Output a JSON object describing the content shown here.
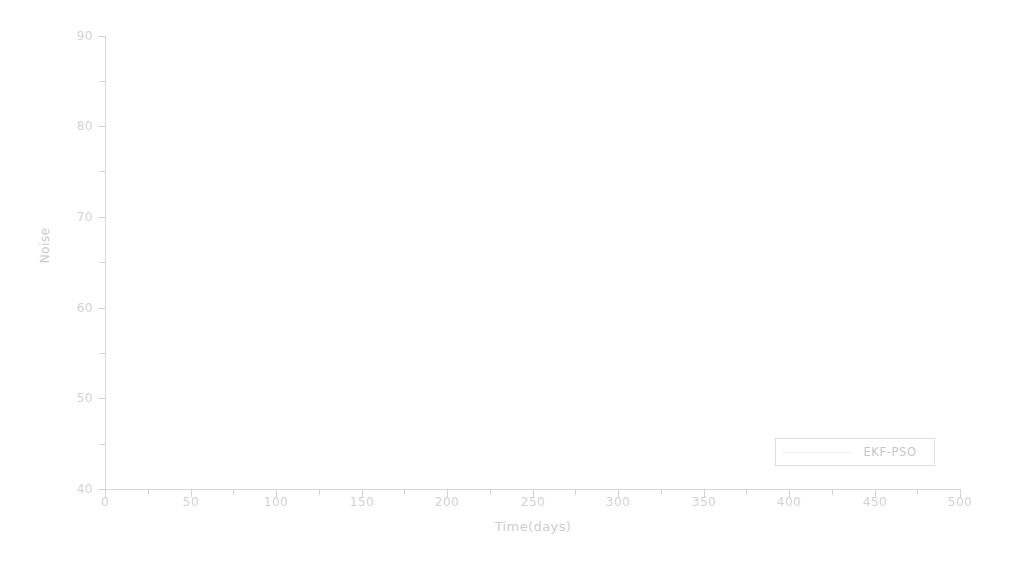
{
  "chart_data": {
    "type": "line",
    "title": "",
    "xlabel": "Time(days)",
    "ylabel": "Noise",
    "xlim": [
      0,
      500
    ],
    "ylim": [
      40,
      90
    ],
    "xticks": [
      0,
      50,
      100,
      150,
      200,
      250,
      300,
      350,
      400,
      450,
      500
    ],
    "yticks": [
      40,
      50,
      60,
      70,
      80,
      90
    ],
    "xtick_labels": [
      "0",
      "50",
      "100",
      "150",
      "200",
      "250",
      "300",
      "350",
      "400",
      "450",
      "500"
    ],
    "ytick_labels": [
      "40",
      "50",
      "60",
      "70",
      "80",
      "90"
    ],
    "grid": false,
    "legend_position": "lower right",
    "series": [
      {
        "name": "EKF-PSO",
        "color": "#f0f0f2",
        "x": [],
        "values": []
      }
    ],
    "note_rendering": "Figure is a heavily faded scan; the plotted data curve is not resolvable in the pixels, only axes, tick labels, axis titles and the legend box are visible."
  },
  "axes": {
    "y_axis_title": "Noise",
    "x_axis_title": "Time(days)",
    "y_tick_labels": [
      "90",
      "80",
      "70",
      "60",
      "50",
      "40"
    ],
    "x_tick_labels": [
      "0",
      "50",
      "100",
      "150",
      "200",
      "250",
      "300",
      "350",
      "400",
      "450",
      "500"
    ]
  },
  "legend": {
    "entries": [
      {
        "label": "EKF-PSO",
        "color": "#f0f0f2"
      }
    ]
  },
  "colors": {
    "background": "#ffffff",
    "axis": "#d8d8dc",
    "tick_label": "#d2d2d6",
    "axis_title": "#cdcdd2",
    "legend_border": "#dedee2",
    "legend_text": "#c6c6cb",
    "series_ekf_pso": "#f0f0f2"
  }
}
